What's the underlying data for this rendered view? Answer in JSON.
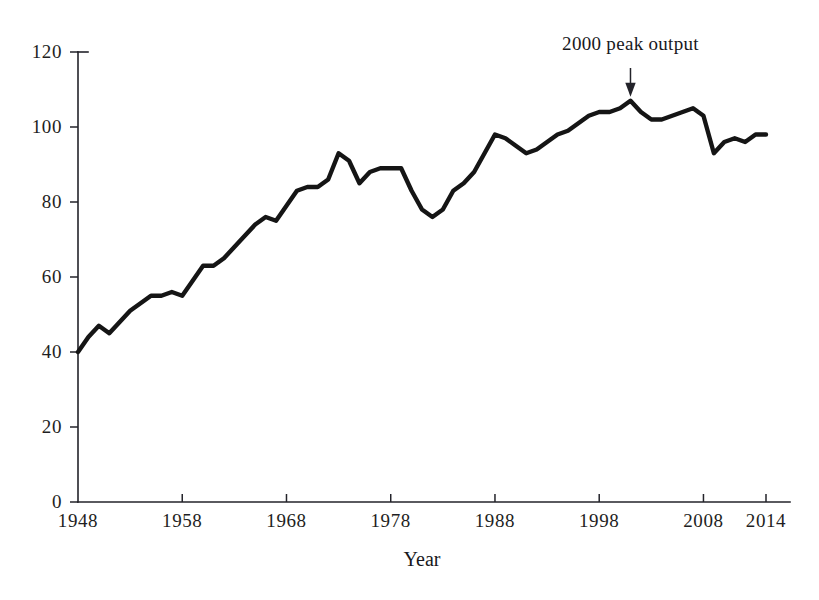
{
  "figure": {
    "top_cropped_text": "",
    "background_color": "#ffffff",
    "line_color": "#151515",
    "axis_color": "#23232a"
  },
  "axes": {
    "x_title": "Year",
    "y_title": ""
  },
  "annotation": {
    "label": "2000 peak output",
    "year": 2001,
    "value": 107
  },
  "chart_data": {
    "type": "line",
    "title": "",
    "subtitle": "",
    "xlabel": "Year",
    "ylabel": "",
    "xlim": [
      1948,
      2014
    ],
    "ylim": [
      0,
      120
    ],
    "grid": false,
    "legend": "none",
    "x_ticks": [
      1948,
      1958,
      1968,
      1978,
      1988,
      1998,
      2008,
      2014
    ],
    "x_tick_labels": [
      "1948",
      "1958",
      "1968",
      "1978",
      "1988",
      "1998",
      "2008",
      "2014"
    ],
    "y_ticks": [
      0,
      20,
      40,
      60,
      80,
      100,
      120
    ],
    "y_tick_labels": [
      "0",
      "20",
      "40",
      "60",
      "80",
      "100",
      "120"
    ],
    "annotations": [
      {
        "text": "2000 peak output",
        "x": 2001,
        "y": 107,
        "arrow": "down"
      }
    ],
    "series": [
      {
        "name": "output",
        "x": [
          1948,
          1949,
          1950,
          1951,
          1952,
          1953,
          1954,
          1955,
          1956,
          1957,
          1958,
          1959,
          1960,
          1961,
          1962,
          1963,
          1964,
          1965,
          1966,
          1967,
          1968,
          1969,
          1970,
          1971,
          1972,
          1973,
          1974,
          1975,
          1976,
          1977,
          1978,
          1979,
          1980,
          1981,
          1982,
          1983,
          1984,
          1985,
          1986,
          1987,
          1988,
          1989,
          1990,
          1991,
          1992,
          1993,
          1994,
          1995,
          1996,
          1997,
          1998,
          1999,
          2000,
          2001,
          2002,
          2003,
          2004,
          2005,
          2006,
          2007,
          2008,
          2009,
          2010,
          2011,
          2012,
          2013,
          2014
        ],
        "values": [
          40,
          44,
          47,
          45,
          48,
          51,
          53,
          55,
          55,
          56,
          55,
          59,
          63,
          63,
          65,
          68,
          71,
          74,
          76,
          75,
          79,
          83,
          84,
          84,
          86,
          93,
          91,
          85,
          88,
          89,
          89,
          89,
          83,
          78,
          76,
          78,
          83,
          85,
          88,
          93,
          98,
          97,
          95,
          93,
          94,
          96,
          98,
          99,
          101,
          103,
          104,
          104,
          105,
          107,
          104,
          102,
          102,
          103,
          104,
          105,
          103,
          93,
          96,
          97,
          96,
          98,
          98
        ]
      }
    ]
  }
}
